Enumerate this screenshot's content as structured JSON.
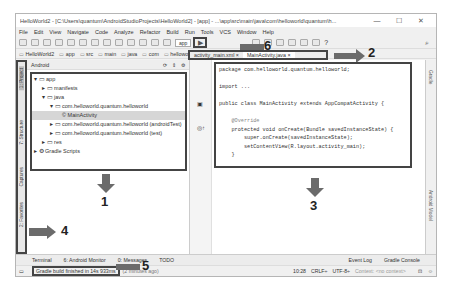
{
  "window": {
    "title": "HelloWorld2 - [C:\\Users\\quantum\\AndroidStudioProjects\\HelloWorld2] - [app] - ...\\app\\src\\main\\java\\com\\helloworld\\quantum\\h...",
    "minimize": "—",
    "maximize": "☐",
    "close": "✕"
  },
  "menu": [
    "File",
    "Edit",
    "View",
    "Navigate",
    "Code",
    "Analyze",
    "Refactor",
    "Build",
    "Run",
    "Tools",
    "VCS",
    "Window",
    "Help"
  ],
  "toolbar": {
    "app_selector": "app",
    "run_icon": "▶",
    "help": "?",
    "search_icon": "⌕"
  },
  "breadcrumb": [
    "HelloWorld2",
    "app",
    "src",
    "main",
    "java",
    "com",
    "helloworld",
    "quantum",
    "helloworld",
    "MainActivity"
  ],
  "left_strip": [
    "1: Project",
    "7: Structure",
    "Captures",
    "2: Favorites"
  ],
  "project": {
    "view_selector": "Android",
    "tree": [
      {
        "label": "▾ ▭ app",
        "indent": 0
      },
      {
        "label": "▸ ▭ manifests",
        "indent": 1
      },
      {
        "label": "▾ ▭ java",
        "indent": 1
      },
      {
        "label": "▾ ▭ com.helloworld.quantum.helloworld",
        "indent": 2
      },
      {
        "label": "© MainActivity",
        "indent": 3,
        "selected": true
      },
      {
        "label": "▸ ▭ com.helloworld.quantum.helloworld (androidTest)",
        "indent": 2
      },
      {
        "label": "▸ ▭ com.helloworld.quantum.helloworld (test)",
        "indent": 2
      },
      {
        "label": "▸ ▭ res",
        "indent": 1
      },
      {
        "label": "▸ ⚙ Gradle Scripts",
        "indent": 0
      }
    ]
  },
  "editor": {
    "tabs": [
      {
        "label": "activity_main.xml ×",
        "active": false
      },
      {
        "label": "MainActivity.java ×",
        "active": true
      }
    ],
    "code": [
      "package com.helloworld.quantum.helloworld;",
      "",
      "import ...",
      "",
      "public class MainActivity extends AppCompatActivity {",
      "",
      "    @Override",
      "    protected void onCreate(Bundle savedInstanceState) {",
      "        super.onCreate(savedInstanceState);",
      "        setContentView(R.layout.activity_main);",
      "    }",
      "}"
    ]
  },
  "right_strip": [
    "Gradle",
    "Android Model"
  ],
  "bottom_tabs": [
    "Terminal",
    "6: Android Monitor",
    "0: Messages",
    "TODO"
  ],
  "bottom_right_tabs": [
    "Event Log",
    "Gradle Console"
  ],
  "status": {
    "message": "Gradle build finished in 14s 933ms",
    "suffix": "(2 minutes ago)",
    "position": "10:28",
    "line_sep": "CRLF÷",
    "encoding": "UTF-8÷",
    "context": "Context: <no context>"
  },
  "annotations": [
    "1",
    "2",
    "3",
    "4",
    "5",
    "6"
  ],
  "colors": {
    "annotation_box": "#444444",
    "arrow": "#6b6b6b",
    "selection": "#d6d6d6"
  }
}
